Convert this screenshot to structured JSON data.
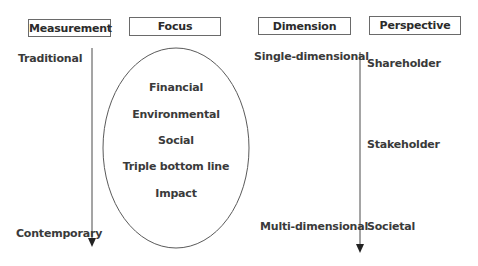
{
  "headers": {
    "measurement": "Measurement",
    "focus": "Focus",
    "dimension": "Dimension",
    "perspective": "Perspective"
  },
  "measurement": {
    "start": "Traditional",
    "end": "Contemporary"
  },
  "focus": {
    "items": [
      "Financial",
      "Environmental",
      "Social",
      "Triple bottom line",
      "Impact"
    ]
  },
  "dimension": {
    "start": "Single-dimensional",
    "end": "Multi-dimensional"
  },
  "perspective": {
    "items": [
      "Shareholder",
      "Stakeholder",
      "Societal"
    ]
  },
  "colors": {
    "line": "#4a4a4a",
    "text": "#2b2b2b",
    "border": "#6a6a6a"
  }
}
